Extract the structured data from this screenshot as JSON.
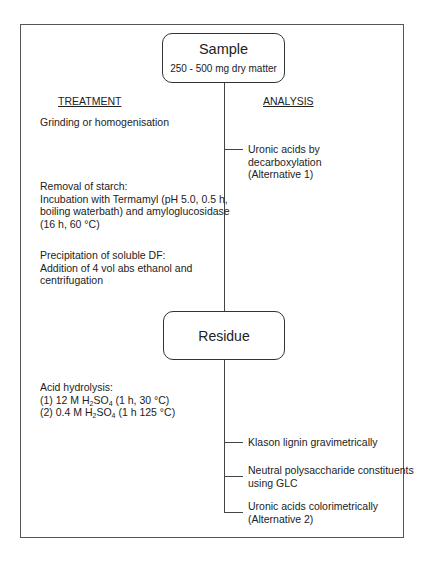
{
  "sample": {
    "title": "Sample",
    "subtitle": "250 - 500 mg dry matter"
  },
  "residue": {
    "title": "Residue"
  },
  "headers": {
    "treatment": "TREATMENT",
    "analysis": "ANALYSIS"
  },
  "treatment": {
    "grinding": "Grinding or homogenisation",
    "starch": [
      "Removal of starch:",
      "Incubation with Termamyl (pH 5.0, 0.5 h,",
      "boiling waterbath) and amyloglucosidase",
      "(16 h, 60 °C)"
    ],
    "precip": [
      "Precipitation of soluble DF:",
      "Addition of 4 vol abs ethanol and",
      "centrifugation"
    ],
    "acid": {
      "title": "Acid hydrolysis:",
      "step1": {
        "pre": "(1) 12 M H",
        "sub1": "2",
        "mid": "SO",
        "sub2": "4",
        "post": " (1 h, 30 °C)"
      },
      "step2": {
        "pre": "(2) 0.4 M H",
        "sub1": "2",
        "mid": "SO",
        "sub2": "4",
        "post": " (1 h 125 °C)"
      }
    }
  },
  "analysis": {
    "uronic1": [
      "Uronic acids by",
      "decarboxylation",
      "(Alternative 1)"
    ],
    "klason": "Klason lignin gravimetrically",
    "neutral": [
      "Neutral polysaccharide constituents",
      "using GLC"
    ],
    "uronic2": [
      "Uronic acids colorimetrically",
      "(Alternative 2)"
    ]
  }
}
